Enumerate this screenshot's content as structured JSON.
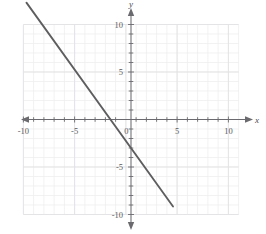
{
  "figure": {
    "name": "coordinate-plane-line-graph",
    "width": 266,
    "height": 234,
    "background_color": "#ffffff"
  },
  "chart_data": {
    "type": "line",
    "title": "",
    "xlabel": "x",
    "ylabel": "y",
    "xlim": [
      -10.7,
      10.7
    ],
    "ylim": [
      -10.5,
      11.5
    ],
    "grid": true,
    "grid_minor_step": 1,
    "grid_major_step": 5,
    "legend": "none",
    "x_tick_labels": [
      "-10",
      "-5",
      "0",
      "5",
      "10"
    ],
    "x_tick_values": [
      -10,
      -5,
      0,
      5,
      10
    ],
    "y_tick_labels": [
      "10",
      "5",
      "-5",
      "-10"
    ],
    "y_tick_values": [
      10,
      5,
      -5,
      -10
    ],
    "origin_label": "0",
    "series": [
      {
        "name": "line",
        "equation": "y = -1.5x - 3",
        "slope": -1.5,
        "y_intercept": -3,
        "x_intercept": -2,
        "color": "#5e5e60",
        "x": [
          -10.2,
          4.1
        ],
        "values": [
          12.3,
          -9.15
        ],
        "points": [
          {
            "x": -10.2,
            "y": 12.3
          },
          {
            "x": -2,
            "y": 0
          },
          {
            "x": 0,
            "y": -3
          },
          {
            "x": 4.1,
            "y": -9.15
          }
        ]
      }
    ]
  },
  "axes": {
    "x_axis_name": "x",
    "y_axis_name": "y",
    "axis_color": "#6b6b6f",
    "grid_color": "#ececed"
  }
}
